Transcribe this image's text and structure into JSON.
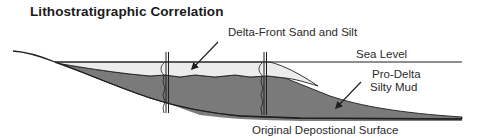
{
  "title": "Lithostratigraphic Correlation",
  "labels": {
    "delta_front": "Delta-Front Sand and Silt",
    "sea_level": "Sea Level",
    "pro_delta_line1": "Pro-Delta",
    "pro_delta_line2": "Silty Mud",
    "original_surface": "Original Depostional Surface"
  },
  "colors": {
    "sand": "#ececec",
    "mud": "#7c7c7c",
    "line": "#1e1e1e",
    "text": "#2a2a2a"
  },
  "wells": [
    {
      "name": "well-1"
    },
    {
      "name": "well-2"
    }
  ]
}
